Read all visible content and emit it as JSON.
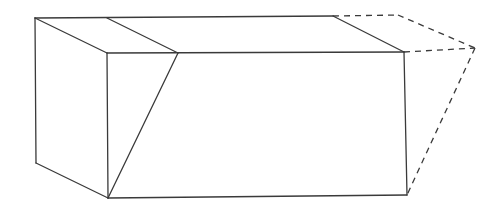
{
  "diagram": {
    "type": "3d-rectangular-prism-with-cut",
    "stroke_color": "#3a3a3a",
    "background": "#ffffff",
    "points": {
      "back_top_left": [
        35,
        18
      ],
      "back_top_mid": [
        107,
        18
      ],
      "back_top_right_solid": [
        333,
        16
      ],
      "back_top_right_dashed": [
        398,
        15
      ],
      "front_top_left": [
        107,
        53
      ],
      "cut_top": [
        178,
        53
      ],
      "front_top_right": [
        404,
        52
      ],
      "ghost_corner": [
        475,
        48
      ],
      "left_bottom": [
        36,
        163
      ],
      "front_bottom_left": [
        108,
        198
      ],
      "front_bottom_right": [
        407,
        195
      ]
    },
    "solid_edges": [
      [
        "back_top_left",
        "back_top_right_solid"
      ],
      [
        "back_top_left",
        "front_top_left"
      ],
      [
        "back_top_mid",
        "cut_top"
      ],
      [
        "back_top_right_solid",
        "front_top_right"
      ],
      [
        "front_top_left",
        "front_top_right"
      ],
      [
        "back_top_left",
        "left_bottom"
      ],
      [
        "left_bottom",
        "front_bottom_left"
      ],
      [
        "front_top_left",
        "front_bottom_left"
      ],
      [
        "cut_top",
        "front_bottom_left"
      ],
      [
        "front_bottom_left",
        "front_bottom_right"
      ],
      [
        "front_top_right",
        "front_bottom_right"
      ]
    ],
    "dashed_edges": [
      [
        "back_top_right_solid",
        "back_top_right_dashed"
      ],
      [
        "back_top_right_dashed",
        "ghost_corner"
      ],
      [
        "front_top_right",
        "ghost_corner"
      ],
      [
        "ghost_corner",
        "front_bottom_right"
      ]
    ]
  }
}
